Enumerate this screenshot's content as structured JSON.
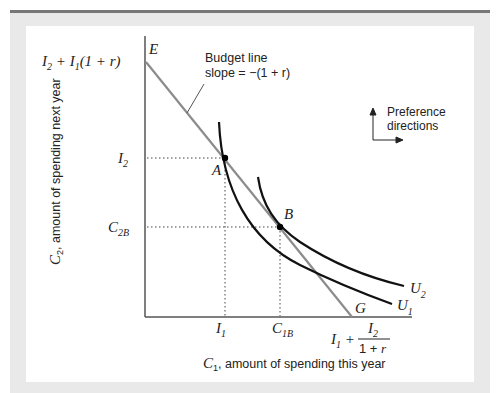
{
  "figure": {
    "y_axis_label_var": "C",
    "y_axis_label_sub": "2",
    "y_axis_label_text": ", amount of spending next year",
    "x_axis_label_var": "C",
    "x_axis_label_sub": "1",
    "x_axis_label_text": ", amount of spending this year",
    "budget_line_label": {
      "line1": "Budget line",
      "line2": "slope = −(1 + r)"
    },
    "preference_label": {
      "line1": "Preference",
      "line2": "directions"
    },
    "points": {
      "E": "E",
      "A": "A",
      "B": "B",
      "G": "G"
    },
    "curves": {
      "U1": {
        "var": "U",
        "sub": "1"
      },
      "U2": {
        "var": "U",
        "sub": "2"
      }
    },
    "y_ticks": {
      "top": {
        "a": "I",
        "a_sub": "2",
        "mid": " + ",
        "b": "I",
        "b_sub": "1",
        "tail": "(1 + ",
        "r": "r",
        "close": ")"
      },
      "I2": {
        "var": "I",
        "sub": "2"
      },
      "C2B": {
        "var": "C",
        "sub": "2B"
      }
    },
    "x_ticks": {
      "I1": {
        "var": "I",
        "sub": "1"
      },
      "C1B": {
        "var": "C",
        "sub": "1B"
      },
      "G_value": {
        "lead_var": "I",
        "lead_sub": "1",
        "plus": " + ",
        "num_var": "I",
        "num_sub": "2",
        "den": "1 + ",
        "den_r": "r"
      }
    },
    "colors": {
      "axis": "#555555",
      "budget_line": "#8c8c8c",
      "indifference": "#111111",
      "frame": "#e9e9e9",
      "rule": "#777777"
    }
  }
}
